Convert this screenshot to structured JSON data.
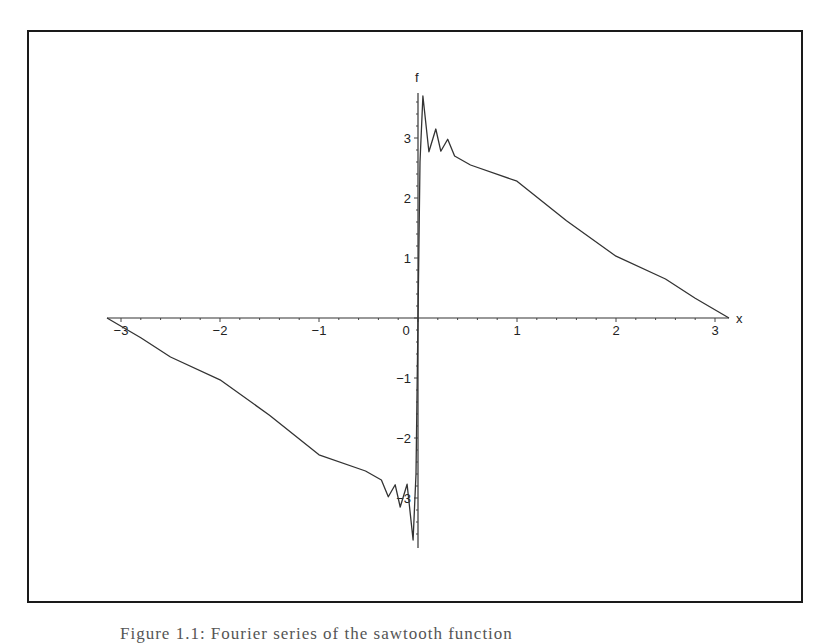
{
  "figure": {
    "caption": "Figure 1.1: Fourier series of the sawtooth function"
  },
  "chart_data": {
    "type": "line",
    "title": "",
    "xlabel": "x",
    "ylabel": "f",
    "xlim": [
      -3.1416,
      3.1416
    ],
    "ylim": [
      -3.8,
      3.8
    ],
    "grid": false,
    "legend": null,
    "x_ticks": [
      -3,
      -2,
      -1,
      0,
      1,
      2,
      3
    ],
    "y_ticks": [
      -3,
      -2,
      -1,
      1,
      2,
      3
    ],
    "x_tick_labels": [
      "−3",
      "−2",
      "−1",
      "0",
      "1",
      "2",
      "3"
    ],
    "y_tick_labels": [
      "−3",
      "−2",
      "−1",
      "1",
      "2",
      "3"
    ],
    "series": [
      {
        "name": "f",
        "color": "#333333",
        "x": [
          -3.1416,
          -2.8,
          -2.5,
          -2.0,
          -1.5,
          -1.0,
          -0.53,
          -0.37,
          -0.3,
          -0.23,
          -0.18,
          -0.11,
          -0.05,
          -0.02,
          0.0,
          0.02,
          0.05,
          0.11,
          0.18,
          0.23,
          0.3,
          0.37,
          0.53,
          1.0,
          1.5,
          2.0,
          2.5,
          2.8,
          3.1416
        ],
        "y": [
          0.0,
          -0.33,
          -0.65,
          -1.03,
          -1.62,
          -2.28,
          -2.55,
          -2.7,
          -2.98,
          -2.78,
          -3.15,
          -2.77,
          -3.7,
          -2.6,
          0.0,
          2.6,
          3.7,
          2.77,
          3.15,
          2.78,
          2.98,
          2.7,
          2.55,
          2.28,
          1.62,
          1.03,
          0.65,
          0.33,
          0.0
        ]
      }
    ]
  },
  "axes": {
    "x_name": "x",
    "y_name": "f"
  }
}
